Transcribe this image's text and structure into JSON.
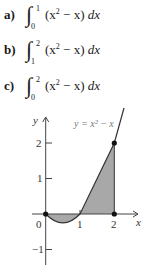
{
  "problems": [
    {
      "label": "a)",
      "lower": "0",
      "upper": "1",
      "integrand_base": "(x",
      "exponent": "2",
      "integrand_rest": " − x) ",
      "differential": "dx"
    },
    {
      "label": "b)",
      "lower": "1",
      "upper": "2",
      "integrand_base": "(x",
      "exponent": "2",
      "integrand_rest": " − x) ",
      "differential": "dx"
    },
    {
      "label": "c)",
      "lower": "0",
      "upper": "2",
      "integrand_base": "(x",
      "exponent": "2",
      "integrand_rest": " − x) ",
      "differential": "dx"
    }
  ],
  "graph": {
    "function_label": "y = x² − x",
    "x_axis_label": "x",
    "y_axis_label": "y",
    "x_ticks": [
      "0",
      "1",
      "2"
    ],
    "y_ticks": [
      "2",
      "1",
      "−1"
    ],
    "points": [
      [
        0,
        0
      ],
      [
        2,
        0
      ],
      [
        2,
        2
      ]
    ],
    "shaded_region": "between curve and x-axis from x=0 to x=2",
    "colors": {
      "curve": "#333333",
      "shade": "#a8a8a8",
      "axis": "#444444"
    }
  }
}
